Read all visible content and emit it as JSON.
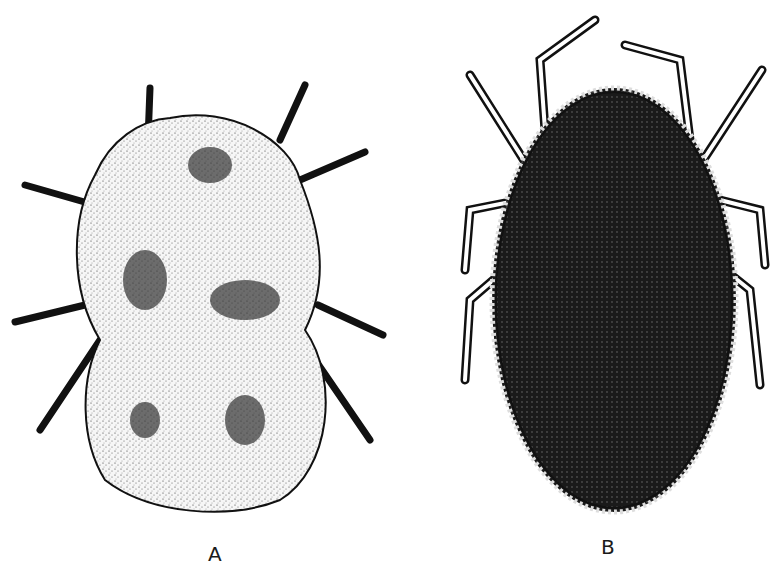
{
  "figure": {
    "panels": [
      {
        "id": "A",
        "label": "A",
        "description": "Engorged mite/tick larva, dorsal view, stippled pale body with dark patches, eight legs"
      },
      {
        "id": "B",
        "label": "B",
        "description": "Adult tick/mite, dorsal view, dark oval body with beaded margin, eight segmented legs"
      }
    ],
    "colors": {
      "ink": "#111111",
      "paper": "#ffffff",
      "body_a": "#f2f2f2",
      "body_b": "#1c1c1c"
    }
  }
}
